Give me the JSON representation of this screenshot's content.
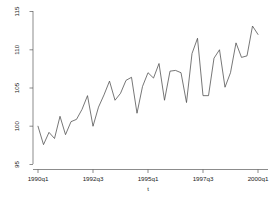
{
  "chart_data": {
    "type": "line",
    "title": "",
    "subtitle": "",
    "xlabel": "t",
    "ylabel": "",
    "grid": false,
    "legend": null,
    "ylim": [
      95,
      115
    ],
    "yticks": [
      95,
      100,
      105,
      110,
      115
    ],
    "ytick_labels": [
      "95",
      "100",
      "105",
      "110",
      "115"
    ],
    "xticks": [
      "1990q1",
      "1992q3",
      "1995q1",
      "1997q3",
      "2000q1"
    ],
    "xtick_labels": [
      "1990q1",
      "1992q3",
      "1995q1",
      "1997q3",
      "2000q1"
    ],
    "xlim": [
      "1990q1",
      "2000q1"
    ],
    "x": [
      "1990q1",
      "1990q2",
      "1990q3",
      "1990q4",
      "1991q1",
      "1991q2",
      "1991q3",
      "1991q4",
      "1992q1",
      "1992q2",
      "1992q3",
      "1992q4",
      "1993q1",
      "1993q2",
      "1993q3",
      "1993q4",
      "1994q1",
      "1994q2",
      "1994q3",
      "1994q4",
      "1995q1",
      "1995q2",
      "1995q3",
      "1995q4",
      "1996q1",
      "1996q2",
      "1996q3",
      "1996q4",
      "1997q1",
      "1997q2",
      "1997q3",
      "1997q4",
      "1998q1",
      "1998q2",
      "1998q3",
      "1998q4",
      "1999q1",
      "1999q2",
      "1999q3",
      "1999q4"
    ],
    "series": [
      {
        "name": "y",
        "color": "#4a4a4a",
        "values": [
          100.0,
          97.6,
          99.2,
          98.4,
          101.3,
          98.9,
          100.6,
          100.9,
          102.2,
          104.0,
          100.0,
          102.5,
          104.1,
          105.9,
          103.4,
          104.3,
          106.0,
          106.4,
          101.7,
          105.2,
          107.0,
          106.3,
          108.2,
          103.4,
          107.2,
          107.3,
          107.0,
          103.1,
          109.5,
          111.5,
          104.0,
          104.0,
          108.9,
          110.0,
          105.1,
          107.0,
          110.9,
          109.0,
          109.2,
          113.1
        ]
      }
    ],
    "final_point": {
      "x": "2000q1",
      "y": 112.0
    }
  },
  "axis": {
    "y_axis_name": "vertical-axis",
    "x_axis_name": "horizontal-axis"
  }
}
